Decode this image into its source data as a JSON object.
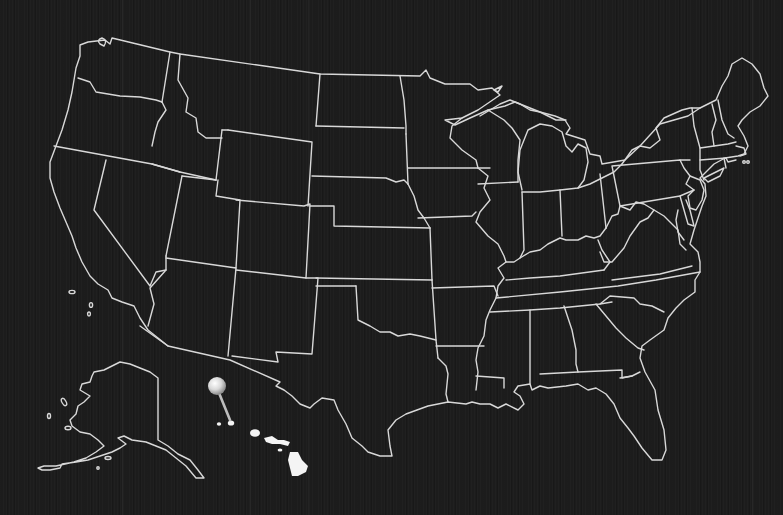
{
  "map": {
    "type": "us-states-outline",
    "background_color": "#1c1c1c",
    "outline_color": "#d8d8d8",
    "inset_regions": [
      "Alaska",
      "Hawaii"
    ],
    "marker": {
      "icon": "map-pin-icon",
      "color": "#e6e6e6",
      "location": "Hawaii"
    }
  }
}
